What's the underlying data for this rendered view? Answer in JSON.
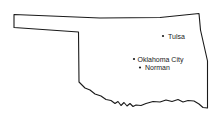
{
  "map": {
    "region": "Oklahoma",
    "outline_color": "#1a1a1a",
    "background": "#ffffff",
    "cities": [
      {
        "name": "Tulsa",
        "x": 163,
        "y": 36,
        "label_x": 168,
        "label_y": 38.5
      },
      {
        "name": "Oklahoma City",
        "x": 134,
        "y": 59,
        "label_x": 137.5,
        "label_y": 61.5
      },
      {
        "name": "Norman",
        "x": 140,
        "y": 67.5,
        "label_x": 145,
        "label_y": 70
      }
    ]
  }
}
